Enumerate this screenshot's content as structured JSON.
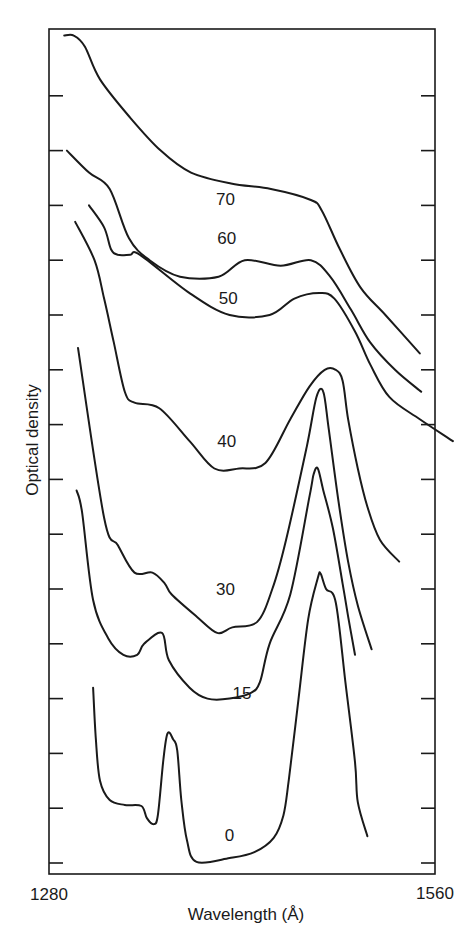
{
  "chart_data": {
    "type": "line",
    "title": "",
    "xlabel": "Wavelength (Å)",
    "ylabel": "Optical density",
    "xlim": [
      1280,
      1560
    ],
    "x_tick_labels": [
      "1280",
      "1560"
    ],
    "y_tick_labels": [],
    "y_units": "arbitrary (curves vertically offset; values in tick-spacing units above bottom axis)",
    "grid": false,
    "legend": "none (curves labelled inline)",
    "line_color": "#1a1a1a",
    "series": [
      {
        "name": "70",
        "label_pos": [
          1408,
          12.2
        ],
        "points": [
          [
            1291,
            15.3
          ],
          [
            1298,
            15.3
          ],
          [
            1306,
            15.1
          ],
          [
            1317,
            14.5
          ],
          [
            1339,
            13.8
          ],
          [
            1361,
            13.2
          ],
          [
            1383,
            12.8
          ],
          [
            1412,
            12.6
          ],
          [
            1441,
            12.5
          ],
          [
            1470,
            12.3
          ],
          [
            1478,
            12.1
          ],
          [
            1491,
            11.4
          ],
          [
            1506,
            10.7
          ],
          [
            1524,
            10.2
          ],
          [
            1549,
            9.5
          ]
        ]
      },
      {
        "name": "60",
        "label_pos": [
          1409,
          11.5
        ],
        "points": [
          [
            1293,
            13.2
          ],
          [
            1309,
            12.8
          ],
          [
            1324,
            12.5
          ],
          [
            1338,
            11.6
          ],
          [
            1353,
            11.2
          ],
          [
            1375,
            10.9
          ],
          [
            1403,
            10.9
          ],
          [
            1422,
            11.2
          ],
          [
            1448,
            11.1
          ],
          [
            1470,
            11.2
          ],
          [
            1484,
            10.9
          ],
          [
            1499,
            10.3
          ],
          [
            1513,
            9.7
          ],
          [
            1531,
            9.2
          ],
          [
            1550,
            8.8
          ]
        ]
      },
      {
        "name": "50",
        "label_pos": [
          1410,
          10.4
        ],
        "points": [
          [
            1309,
            12.2
          ],
          [
            1320,
            11.8
          ],
          [
            1325,
            11.4
          ],
          [
            1330,
            11.3
          ],
          [
            1339,
            11.3
          ],
          [
            1346,
            11.3
          ],
          [
            1382,
            10.6
          ],
          [
            1411,
            10.2
          ],
          [
            1440,
            10.2
          ],
          [
            1458,
            10.5
          ],
          [
            1476,
            10.6
          ],
          [
            1487,
            10.5
          ],
          [
            1502,
            9.9
          ],
          [
            1513,
            9.3
          ],
          [
            1527,
            8.7
          ],
          [
            1549,
            8.3
          ],
          [
            1573,
            7.9
          ]
        ]
      },
      {
        "name": "40",
        "label_pos": [
          1409,
          7.8
        ],
        "points": [
          [
            1299,
            11.9
          ],
          [
            1313,
            11.2
          ],
          [
            1320,
            10.5
          ],
          [
            1327,
            9.7
          ],
          [
            1335,
            8.8
          ],
          [
            1342,
            8.6
          ],
          [
            1360,
            8.5
          ],
          [
            1382,
            7.9
          ],
          [
            1400,
            7.4
          ],
          [
            1418,
            7.4
          ],
          [
            1437,
            7.5
          ],
          [
            1455,
            8.3
          ],
          [
            1469,
            8.9
          ],
          [
            1480,
            9.2
          ],
          [
            1488,
            9.2
          ],
          [
            1493,
            9.0
          ],
          [
            1497,
            8.3
          ],
          [
            1504,
            7.4
          ],
          [
            1511,
            6.7
          ],
          [
            1520,
            6.1
          ],
          [
            1534,
            5.7
          ]
        ]
      },
      {
        "name": "30",
        "label_pos": [
          1408,
          5.1
        ],
        "points": [
          [
            1301,
            9.6
          ],
          [
            1320,
            6.5
          ],
          [
            1330,
            6.0
          ],
          [
            1342,
            5.5
          ],
          [
            1355,
            5.5
          ],
          [
            1364,
            5.3
          ],
          [
            1369,
            5.1
          ],
          [
            1387,
            4.7
          ],
          [
            1402,
            4.4
          ],
          [
            1413,
            4.5
          ],
          [
            1431,
            4.6
          ],
          [
            1442,
            5.2
          ],
          [
            1452,
            6.1
          ],
          [
            1467,
            7.8
          ],
          [
            1474,
            8.7
          ],
          [
            1479,
            8.8
          ],
          [
            1483,
            8.1
          ],
          [
            1490,
            6.8
          ],
          [
            1497,
            5.7
          ],
          [
            1504,
            4.9
          ],
          [
            1514,
            4.1
          ]
        ]
      },
      {
        "name": "15",
        "label_pos": [
          1420,
          3.2
        ],
        "points": [
          [
            1300,
            7.0
          ],
          [
            1304,
            6.6
          ],
          [
            1312,
            5.0
          ],
          [
            1323,
            4.3
          ],
          [
            1334,
            4.0
          ],
          [
            1344,
            4.0
          ],
          [
            1349,
            4.2
          ],
          [
            1362,
            4.4
          ],
          [
            1367,
            3.9
          ],
          [
            1382,
            3.4
          ],
          [
            1395,
            3.2
          ],
          [
            1411,
            3.2
          ],
          [
            1426,
            3.3
          ],
          [
            1433,
            3.5
          ],
          [
            1440,
            4.2
          ],
          [
            1455,
            5.1
          ],
          [
            1469,
            6.9
          ],
          [
            1472,
            7.3
          ],
          [
            1475,
            7.4
          ],
          [
            1479,
            7.0
          ],
          [
            1486,
            6.3
          ],
          [
            1493,
            5.3
          ],
          [
            1497,
            4.7
          ],
          [
            1502,
            4.0
          ]
        ]
      },
      {
        "name": "0",
        "label_pos": [
          1411,
          0.6
        ],
        "points": [
          [
            1312,
            3.4
          ],
          [
            1314,
            2.45
          ],
          [
            1317,
            1.7
          ],
          [
            1324,
            1.35
          ],
          [
            1335,
            1.26
          ],
          [
            1347,
            1.24
          ],
          [
            1351,
            1.02
          ],
          [
            1356,
            0.91
          ],
          [
            1359,
            1.08
          ],
          [
            1363,
            2.09
          ],
          [
            1366,
            2.57
          ],
          [
            1370,
            2.46
          ],
          [
            1373,
            2.26
          ],
          [
            1376,
            1.35
          ],
          [
            1380,
            0.62
          ],
          [
            1387,
            0.22
          ],
          [
            1411,
            0.29
          ],
          [
            1429,
            0.4
          ],
          [
            1443,
            0.66
          ],
          [
            1450,
            1.07
          ],
          [
            1454,
            1.73
          ],
          [
            1461,
            3.19
          ],
          [
            1468,
            4.65
          ],
          [
            1475,
            5.4
          ],
          [
            1477,
            5.48
          ],
          [
            1481,
            5.2
          ],
          [
            1488,
            4.96
          ],
          [
            1495,
            3.5
          ],
          [
            1502,
            2.04
          ],
          [
            1504,
            1.31
          ],
          [
            1511,
            0.69
          ]
        ]
      }
    ]
  },
  "axes": {
    "x_label": "Wavelength (Å)",
    "y_label": "Optical density",
    "x_min_label": "1280",
    "x_max_label": "1560"
  }
}
